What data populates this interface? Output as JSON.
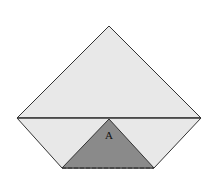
{
  "diagram": {
    "region_label": "A",
    "colors": {
      "background": "#ffffff",
      "light_fill": "#e8e8e8",
      "shaded_fill": "#8a8a8a",
      "stroke": "#333333"
    }
  }
}
